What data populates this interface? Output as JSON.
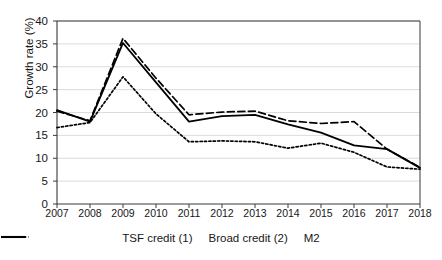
{
  "chart_data": {
    "type": "line",
    "title": "",
    "xlabel": "",
    "ylabel": "Growth rate (%)",
    "ylim": [
      0,
      40
    ],
    "ytick_step": 5,
    "yticks": [
      "0",
      "5",
      "10",
      "15",
      "20",
      "25",
      "30",
      "35",
      "40"
    ],
    "grid": true,
    "legend_position": "bottom",
    "categories": [
      "2007",
      "2008",
      "2009",
      "2010",
      "2011",
      "2012",
      "2013",
      "2014",
      "2015",
      "2016",
      "2017",
      "2018"
    ],
    "series": [
      {
        "name": "TSF credit (1)",
        "style": "solid",
        "color": "#000000",
        "values": [
          20.5,
          18.0,
          35.2,
          26.6,
          18.0,
          19.2,
          19.5,
          17.4,
          15.6,
          12.8,
          12.0,
          7.9
        ]
      },
      {
        "name": "Broad credit (2)",
        "style": "dashed",
        "color": "#000000",
        "values": [
          20.3,
          18.2,
          36.2,
          27.5,
          19.5,
          20.1,
          20.3,
          18.2,
          17.6,
          18.0,
          12.0,
          8.0
        ]
      },
      {
        "name": "M2",
        "style": "dotted",
        "color": "#000000",
        "values": [
          16.7,
          17.8,
          27.8,
          19.7,
          13.6,
          13.8,
          13.6,
          12.2,
          13.3,
          11.3,
          8.1,
          7.6
        ]
      }
    ]
  },
  "axis": {
    "y_label": "Growth rate (%)"
  },
  "legend": {
    "items": [
      {
        "label": "TSF credit (1)",
        "style": "solid"
      },
      {
        "label": "Broad credit (2)",
        "style": "dashed"
      },
      {
        "label": "M2",
        "style": "dotted"
      }
    ]
  }
}
